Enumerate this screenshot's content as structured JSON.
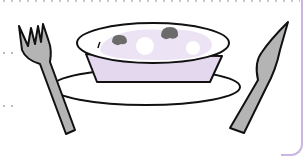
{
  "illustration": {
    "subject": "place setting with fork, plate, bowl of soup with mushrooms, and knife",
    "elements": [
      "fork-icon",
      "plate",
      "bowl",
      "soup",
      "mushroom-icon",
      "knife-icon"
    ],
    "colors": {
      "outline": "#111111",
      "utensil_fill": "#b4b4b4",
      "bowl_fill": "#e4d8ef",
      "soup_fill": "#ece3f4",
      "mushroom_fill": "#6b6b6b",
      "card_border": "#c9b6e4",
      "dots": "#c8c8c8"
    }
  }
}
